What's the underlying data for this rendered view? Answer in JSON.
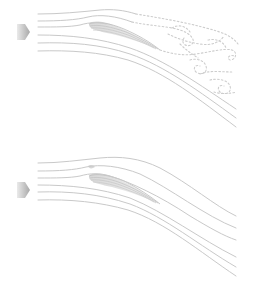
{
  "diagram": {
    "colors": {
      "streamline": "#c8c8c8",
      "wake": "#cfcfcf",
      "airfoil": "#bdbdbd",
      "arrow_dark": "#a8a8a8",
      "arrow_light": "#eaeaea",
      "background": "#ffffff"
    },
    "panels": [
      {
        "id": "stalled",
        "description": "Flow separated from airfoil with turbulent wake of vortices",
        "flow_direction_icon": "arrow-right-icon",
        "streamline_count": 6,
        "wake": "dashed-vortices"
      },
      {
        "id": "attached",
        "description": "Smooth attached flow following the airfoil",
        "flow_direction_icon": "arrow-right-icon",
        "streamline_count": 6,
        "wake": "none"
      }
    ]
  }
}
